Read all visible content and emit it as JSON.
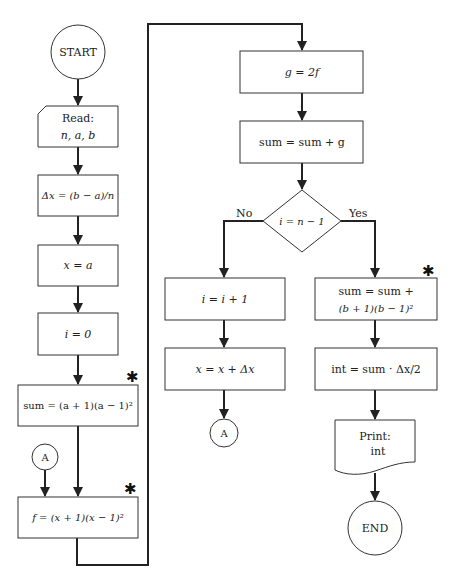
{
  "flowchart": {
    "start": {
      "label": "START"
    },
    "read": {
      "line1": "Read:",
      "line2": "n, a, b"
    },
    "delta_x": {
      "label": "Δx = (b − a)/n"
    },
    "init_x": {
      "label": "x = a"
    },
    "init_i": {
      "label": "i = 0"
    },
    "init_sum": {
      "label": "sum = (a + 1)(a − 1)²",
      "marker": "✱"
    },
    "connector_in": {
      "label": "A"
    },
    "compute_f": {
      "label": "f = (x + 1)(x − 1)²",
      "marker": "✱"
    },
    "compute_g": {
      "label": "g = 2f"
    },
    "accumulate": {
      "label": "sum = sum + g"
    },
    "decision": {
      "label": "i = n − 1",
      "no_label": "No",
      "yes_label": "Yes"
    },
    "increment_i": {
      "label": "i = i + 1"
    },
    "increment_x": {
      "label": "x = x + Δx"
    },
    "connector_out": {
      "label": "A"
    },
    "final_sum": {
      "line1": "sum = sum +",
      "line2": "(b + 1)(b − 1)²",
      "marker": "✱"
    },
    "integral": {
      "label": "int = sum · Δx/2"
    },
    "print": {
      "line1": "Print:",
      "line2": "int"
    },
    "end": {
      "label": "END"
    }
  },
  "colors": {
    "stroke": "#333333",
    "line": "#222222",
    "background": "#ffffff"
  }
}
